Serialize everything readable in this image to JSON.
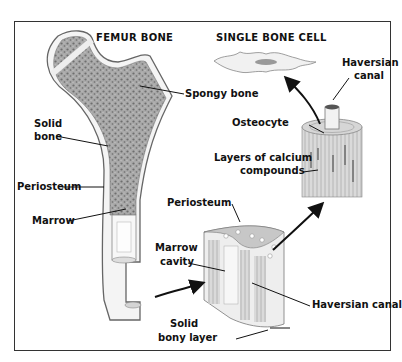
{
  "titles": {
    "femur": "FEMUR BONE",
    "cell": "SINGLE BONE CELL"
  },
  "labels": {
    "spongy_bone": "Spongy bone",
    "solid_bone_1": "Solid",
    "solid_bone_2": "bone",
    "periosteum_left": "Periosteum",
    "marrow": "Marrow",
    "haversian_canal_top_1": "Haversian",
    "haversian_canal_top_2": "canal",
    "osteocyte": "Osteocyte",
    "calcium_1": "Layers of calcium",
    "calcium_2": "compounds",
    "periosteum_right": "Periosteum",
    "marrow_cavity_1": "Marrow",
    "marrow_cavity_2": "cavity",
    "haversian_canal_bottom": "Haversian canal",
    "solid_bony_layer_1": "Solid",
    "solid_bony_layer_2": "bony layer"
  },
  "colors": {
    "frame": "#333333",
    "bone_fill": "#f2f2f2",
    "spongy": "#8a8a8a",
    "line": "#111111"
  }
}
